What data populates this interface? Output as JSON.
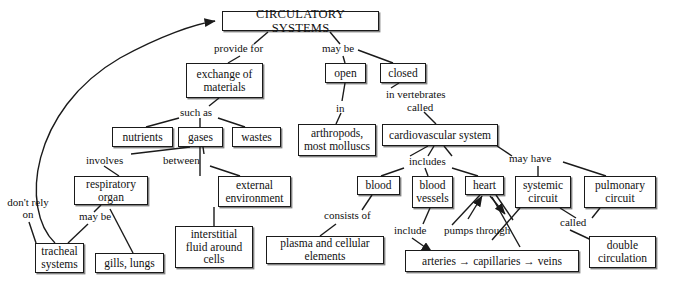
{
  "diagram": {
    "title": "CIRCULATORY SYSTEMS",
    "type": "concept-map",
    "nodes": [
      {
        "id": "circulatory_systems",
        "label": "CIRCULATORY SYSTEMS",
        "x": 222,
        "y": 11,
        "w": 157,
        "h": 20
      },
      {
        "id": "exchange_of_materials",
        "label": "exchange of materials",
        "x": 186,
        "y": 63,
        "w": 77,
        "h": 35
      },
      {
        "id": "open",
        "label": "open",
        "x": 325,
        "y": 63,
        "w": 41,
        "h": 20
      },
      {
        "id": "closed",
        "label": "closed",
        "x": 380,
        "y": 63,
        "w": 46,
        "h": 20
      },
      {
        "id": "nutrients",
        "label": "nutrients",
        "x": 112,
        "y": 127,
        "w": 61,
        "h": 20
      },
      {
        "id": "gases",
        "label": "gases",
        "x": 178,
        "y": 127,
        "w": 45,
        "h": 20
      },
      {
        "id": "wastes",
        "label": "wastes",
        "x": 232,
        "y": 127,
        "w": 49,
        "h": 20
      },
      {
        "id": "arthropods_most_molluscs",
        "label": "arthropods, most molluscs",
        "x": 298,
        "y": 124,
        "w": 78,
        "h": 32
      },
      {
        "id": "cardiovascular_system",
        "label": "cardiovascular system",
        "x": 382,
        "y": 124,
        "w": 116,
        "h": 22
      },
      {
        "id": "respiratory_organ",
        "label": "respiratory organ",
        "x": 74,
        "y": 176,
        "w": 74,
        "h": 29
      },
      {
        "id": "external_environment",
        "label": "external environment",
        "x": 218,
        "y": 176,
        "w": 73,
        "h": 31
      },
      {
        "id": "blood",
        "label": "blood",
        "x": 357,
        "y": 176,
        "w": 43,
        "h": 19
      },
      {
        "id": "blood_vessels",
        "label": "blood vessels",
        "x": 412,
        "y": 176,
        "w": 41,
        "h": 32
      },
      {
        "id": "heart",
        "label": "heart",
        "x": 465,
        "y": 176,
        "w": 39,
        "h": 19
      },
      {
        "id": "systemic_circuit",
        "label": "systemic circuit",
        "x": 515,
        "y": 176,
        "w": 56,
        "h": 32
      },
      {
        "id": "pulmonary_circuit",
        "label": "pulmonary circuit",
        "x": 584,
        "y": 176,
        "w": 72,
        "h": 32
      },
      {
        "id": "tracheal_systems",
        "label": "tracheal systems",
        "x": 35,
        "y": 243,
        "w": 49,
        "h": 30
      },
      {
        "id": "gills_lungs",
        "label": "gills, lungs",
        "x": 95,
        "y": 253,
        "w": 69,
        "h": 20
      },
      {
        "id": "interstitial_fluid_around_cells",
        "label": "interstitial fluid around cells",
        "x": 175,
        "y": 226,
        "w": 78,
        "h": 42
      },
      {
        "id": "plasma_and_cellular_elements",
        "label": "plasma and cellular elements",
        "x": 266,
        "y": 236,
        "w": 118,
        "h": 28
      },
      {
        "id": "arteries_capillaries_veins",
        "label": "arteries → capillaries → veins",
        "x": 405,
        "y": 250,
        "w": 174,
        "h": 22
      },
      {
        "id": "double_circulation",
        "label": "double circulation",
        "x": 589,
        "y": 236,
        "w": 67,
        "h": 32
      }
    ],
    "edge_labels": [
      {
        "id": "provide_for",
        "text": "provide for",
        "x": 214,
        "y": 42
      },
      {
        "id": "may_be",
        "text": "may be",
        "x": 322,
        "y": 42
      },
      {
        "id": "such_as",
        "text": "such as",
        "x": 180,
        "y": 108
      },
      {
        "id": "in",
        "text": "in",
        "x": 339,
        "y": 105
      },
      {
        "id": "in_vertebrates",
        "text": "in vertebrates",
        "x": 386,
        "y": 91
      },
      {
        "id": "called_1",
        "text": "called",
        "x": 407,
        "y": 104
      },
      {
        "id": "involves",
        "text": "involves",
        "x": 86,
        "y": 157
      },
      {
        "id": "between",
        "text": "between",
        "x": 168,
        "y": 157
      },
      {
        "id": "includes",
        "text": "includes",
        "x": 409,
        "y": 158
      },
      {
        "id": "may_have",
        "text": "may have",
        "x": 511,
        "y": 155
      },
      {
        "id": "dont_rely_on",
        "text": "don't rely on",
        "x": 8,
        "y": 209
      },
      {
        "id": "may_be_2",
        "text": "may be",
        "x": 84,
        "y": 213
      },
      {
        "id": "consists_of",
        "text": "consists of",
        "x": 324,
        "y": 212
      },
      {
        "id": "include",
        "text": "include",
        "x": 399,
        "y": 227
      },
      {
        "id": "pumps_through",
        "text": "pumps through",
        "x": 448,
        "y": 227
      },
      {
        "id": "called_2",
        "text": "called",
        "x": 566,
        "y": 219
      }
    ]
  }
}
